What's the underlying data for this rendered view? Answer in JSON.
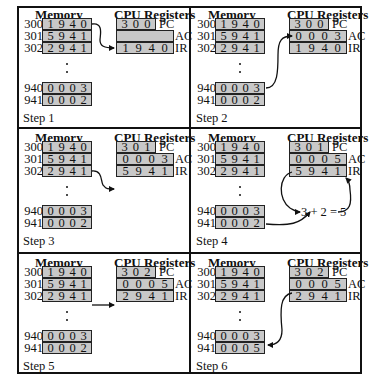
{
  "headers": {
    "memory": "Memory",
    "cpu": "CPU Registers"
  },
  "register_labels": {
    "pc": "PC",
    "ac": "AC",
    "ir": "IR"
  },
  "steps": [
    {
      "label": "Step 1",
      "memory": [
        {
          "addr": "300",
          "digits": [
            "1",
            "9",
            "4",
            "0"
          ]
        },
        {
          "addr": "301",
          "digits": [
            "5",
            "9",
            "4",
            "1"
          ]
        },
        {
          "addr": "302",
          "digits": [
            "2",
            "9",
            "4",
            "1"
          ]
        },
        {
          "addr": "940",
          "digits": [
            "0",
            "0",
            "0",
            "3"
          ]
        },
        {
          "addr": "941",
          "digits": [
            "0",
            "0",
            "0",
            "2"
          ]
        }
      ],
      "pc": [
        "3",
        "0",
        "0"
      ],
      "ac": [
        "",
        "",
        "",
        ""
      ],
      "ir": [
        "1",
        "9",
        "4",
        "0"
      ]
    },
    {
      "label": "Step 2",
      "memory": [
        {
          "addr": "300",
          "digits": [
            "1",
            "9",
            "4",
            "0"
          ]
        },
        {
          "addr": "301",
          "digits": [
            "5",
            "9",
            "4",
            "1"
          ]
        },
        {
          "addr": "302",
          "digits": [
            "2",
            "9",
            "4",
            "1"
          ]
        },
        {
          "addr": "940",
          "digits": [
            "0",
            "0",
            "0",
            "3"
          ]
        },
        {
          "addr": "941",
          "digits": [
            "0",
            "0",
            "0",
            "2"
          ]
        }
      ],
      "pc": [
        "3",
        "0",
        "0"
      ],
      "ac": [
        "0",
        "0",
        "0",
        "3"
      ],
      "ir": [
        "1",
        "9",
        "4",
        "0"
      ]
    },
    {
      "label": "Step 3",
      "memory": [
        {
          "addr": "300",
          "digits": [
            "1",
            "9",
            "4",
            "0"
          ]
        },
        {
          "addr": "301",
          "digits": [
            "5",
            "9",
            "4",
            "1"
          ]
        },
        {
          "addr": "302",
          "digits": [
            "2",
            "9",
            "4",
            "1"
          ]
        },
        {
          "addr": "940",
          "digits": [
            "0",
            "0",
            "0",
            "3"
          ]
        },
        {
          "addr": "941",
          "digits": [
            "0",
            "0",
            "0",
            "2"
          ]
        }
      ],
      "pc": [
        "3",
        "0",
        "1"
      ],
      "ac": [
        "0",
        "0",
        "0",
        "3"
      ],
      "ir": [
        "5",
        "9",
        "4",
        "1"
      ]
    },
    {
      "label": "Step 4",
      "memory": [
        {
          "addr": "300",
          "digits": [
            "1",
            "9",
            "4",
            "0"
          ]
        },
        {
          "addr": "301",
          "digits": [
            "5",
            "9",
            "4",
            "1"
          ]
        },
        {
          "addr": "302",
          "digits": [
            "2",
            "9",
            "4",
            "1"
          ]
        },
        {
          "addr": "940",
          "digits": [
            "0",
            "0",
            "0",
            "3"
          ]
        },
        {
          "addr": "941",
          "digits": [
            "0",
            "0",
            "0",
            "2"
          ]
        }
      ],
      "pc": [
        "3",
        "0",
        "1"
      ],
      "ac": [
        "0",
        "0",
        "0",
        "5"
      ],
      "ir": [
        "5",
        "9",
        "4",
        "1"
      ],
      "equation": "3 + 2 = 5"
    },
    {
      "label": "Step 5",
      "memory": [
        {
          "addr": "300",
          "digits": [
            "1",
            "9",
            "4",
            "0"
          ]
        },
        {
          "addr": "301",
          "digits": [
            "5",
            "9",
            "4",
            "1"
          ]
        },
        {
          "addr": "302",
          "digits": [
            "2",
            "9",
            "4",
            "1"
          ]
        },
        {
          "addr": "940",
          "digits": [
            "0",
            "0",
            "0",
            "3"
          ]
        },
        {
          "addr": "941",
          "digits": [
            "0",
            "0",
            "0",
            "2"
          ]
        }
      ],
      "pc": [
        "3",
        "0",
        "2"
      ],
      "ac": [
        "0",
        "0",
        "0",
        "5"
      ],
      "ir": [
        "2",
        "9",
        "4",
        "1"
      ]
    },
    {
      "label": "Step 6",
      "memory": [
        {
          "addr": "300",
          "digits": [
            "1",
            "9",
            "4",
            "0"
          ]
        },
        {
          "addr": "301",
          "digits": [
            "5",
            "9",
            "4",
            "1"
          ]
        },
        {
          "addr": "302",
          "digits": [
            "2",
            "9",
            "4",
            "1"
          ]
        },
        {
          "addr": "940",
          "digits": [
            "0",
            "0",
            "0",
            "3"
          ]
        },
        {
          "addr": "941",
          "digits": [
            "0",
            "0",
            "0",
            "5"
          ]
        }
      ],
      "pc": [
        "3",
        "0",
        "2"
      ],
      "ac": [
        "0",
        "0",
        "0",
        "5"
      ],
      "ir": [
        "2",
        "9",
        "4",
        "1"
      ]
    }
  ],
  "colors": {
    "cell_fill": "#c8c8c8",
    "border": "#111111",
    "background": "#ffffff"
  }
}
